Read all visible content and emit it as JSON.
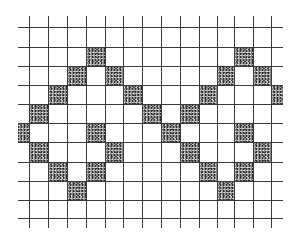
{
  "diagram": {
    "title": "",
    "grid": {
      "vertical_lines_x": [
        29,
        48,
        67,
        86,
        105,
        123,
        142,
        161,
        180,
        199,
        217,
        234,
        253,
        271
      ],
      "vertical_span_y": [
        16,
        228
      ],
      "horizontal_lines_y": [
        27,
        47,
        66,
        85,
        104,
        123,
        142,
        162,
        181,
        200,
        218
      ],
      "horizontal_span_x": [
        18,
        283
      ],
      "line_color": "#3a3a3a",
      "partial_left_column_x": [
        18,
        29
      ],
      "partial_right_column_x": [
        271,
        283
      ]
    },
    "shaded_cells": [
      {
        "row": 1,
        "col": 3
      },
      {
        "row": 1,
        "col": 11
      },
      {
        "row": 2,
        "col": 2
      },
      {
        "row": 2,
        "col": 4
      },
      {
        "row": 2,
        "col": 10
      },
      {
        "row": 2,
        "col": 12
      },
      {
        "row": 3,
        "col": 1
      },
      {
        "row": 3,
        "col": 5
      },
      {
        "row": 3,
        "col": 9
      },
      {
        "row": 3,
        "col": 13
      },
      {
        "row": 4,
        "col": 0
      },
      {
        "row": 4,
        "col": 6
      },
      {
        "row": 4,
        "col": 8
      },
      {
        "row": 5,
        "col": -1
      },
      {
        "row": 5,
        "col": 3
      },
      {
        "row": 5,
        "col": 7
      },
      {
        "row": 5,
        "col": 11
      },
      {
        "row": 6,
        "col": 0
      },
      {
        "row": 6,
        "col": 4
      },
      {
        "row": 6,
        "col": 8
      },
      {
        "row": 6,
        "col": 12
      },
      {
        "row": 7,
        "col": 1
      },
      {
        "row": 7,
        "col": 3
      },
      {
        "row": 7,
        "col": 9
      },
      {
        "row": 7,
        "col": 11
      },
      {
        "row": 8,
        "col": 2
      },
      {
        "row": 8,
        "col": 10
      }
    ],
    "shade_color": "#8a8a8a"
  }
}
